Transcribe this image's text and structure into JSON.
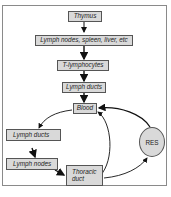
{
  "diagram": {
    "nodes": [
      {
        "id": "thymus",
        "label": "Thymus",
        "shape": "box"
      },
      {
        "id": "lymphoid_organs",
        "label": "Lymph nodes, spleen, liver, etc",
        "shape": "box"
      },
      {
        "id": "t_lymphocytes",
        "label": "T-lymphocytes",
        "shape": "box"
      },
      {
        "id": "lymph_ducts_top",
        "label": "Lymph ducts",
        "shape": "box"
      },
      {
        "id": "blood",
        "label": "Blood",
        "shape": "box"
      },
      {
        "id": "lymph_ducts_left",
        "label": "Lymph ducts",
        "shape": "box"
      },
      {
        "id": "lymph_nodes",
        "label": "Lymph nodes",
        "shape": "box"
      },
      {
        "id": "thoracic_duct",
        "label_line1": "Thoracic",
        "label_line2": "duct",
        "shape": "box"
      },
      {
        "id": "res",
        "label": "RES",
        "shape": "ellipse"
      }
    ],
    "edges": [
      {
        "from": "thymus",
        "to": "lymphoid_organs"
      },
      {
        "from": "lymphoid_organs",
        "to": "t_lymphocytes"
      },
      {
        "from": "t_lymphocytes",
        "to": "lymph_ducts_top"
      },
      {
        "from": "lymph_ducts_top",
        "to": "blood"
      },
      {
        "from": "blood",
        "to": "lymph_ducts_left"
      },
      {
        "from": "lymph_ducts_left",
        "to": "lymph_nodes"
      },
      {
        "from": "lymph_nodes",
        "to": "thoracic_duct"
      },
      {
        "from": "thoracic_duct",
        "to": "blood"
      },
      {
        "from": "thoracic_duct",
        "to": "res"
      },
      {
        "from": "res",
        "to": "blood"
      }
    ],
    "colors": {
      "box_fill": "#d9d9d9",
      "stroke": "#222222",
      "frame": "#8a8a8a"
    }
  }
}
